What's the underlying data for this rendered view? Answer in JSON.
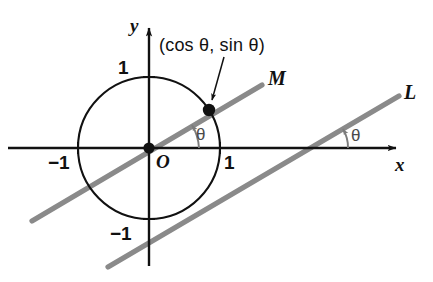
{
  "figure": {
    "kind": "unit-circle-trigonometry-diagram",
    "background_color": "#ffffff",
    "axis_color": "#111111",
    "circle_color": "#111111",
    "line_color": "#8a8a8a",
    "angle_mark_color": "#7d7d7d",
    "point_color": "#111111"
  },
  "axes": {
    "x_label": "x",
    "y_label": "y",
    "origin_label": "O",
    "x_ticks": [
      {
        "label": "−1",
        "value": -1
      },
      {
        "label": "1",
        "value": 1
      }
    ],
    "y_ticks": [
      {
        "label": "1",
        "value": 1
      },
      {
        "label": "−1",
        "value": -1
      }
    ]
  },
  "circle": {
    "radius_label": "1",
    "center_x": 0,
    "center_y": 0,
    "radius": 1
  },
  "point": {
    "coords_label": "(cos θ, sin θ)",
    "x": 0.848,
    "y": 0.535
  },
  "lines": [
    {
      "name": "M",
      "label": "M",
      "description": "line through origin with slope tan theta"
    },
    {
      "name": "L",
      "label": "L",
      "description": "line parallel to M crossing the x-axis to the right"
    }
  ],
  "angles": [
    {
      "id": "theta-at-origin",
      "label": "θ"
    },
    {
      "id": "theta-at-line-l",
      "label": "θ"
    }
  ]
}
